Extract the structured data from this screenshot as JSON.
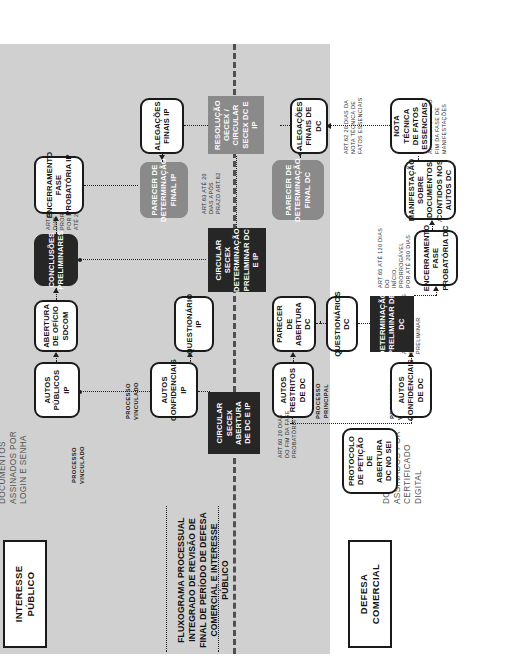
{
  "caption": "Imagem – Prazos processuais nas revisões de final de período com avaliação de interesse público",
  "title": "FLUXOGRAMA PROCESSUAL INTEGRADO DE REVISÃO DE FINAL DE PERÍODO DE DEFESA COMERCIAL E INTERESSE PÚBLICO",
  "headers": {
    "defesa_comercial": "DEFESA\nCOMERCIAL",
    "interesse_publico": "INTERESSE\nPÚBLICO"
  },
  "sidenotes": {
    "digital": "DOCUMENTOS\nASSINADOS POR\nCERTIFICADO\nDIGITAL",
    "login": "DOCUMENTOS\nASSINADOS POR\nLOGIN E SENHA"
  },
  "flow_labels": {
    "processo_principal": "PROCESSO\nPRINCIPAL",
    "processo_vinculado_dc": "PROCESSO\nVINCULADO",
    "processo_vinculado_ip1": "PROCESSO\nVINCULADO",
    "processo_vinculado_ip2": "PROCESSO\nVINCULADO"
  },
  "nodes": {
    "protocolo": {
      "label": "PROTOCOLO DE PETIÇÃO DE ABERTURA DC NO SEI",
      "style": "white"
    },
    "autos_restritos_dc": {
      "label": "AUTOS RESTRITOS DE DC",
      "style": "white"
    },
    "autos_confidenciais_dc": {
      "label": "AUTOS CONFIDENCIAIS DE DC",
      "style": "white"
    },
    "parecer_abertura_dc": {
      "label": "PARECER DE ABERTURA DC",
      "style": "white"
    },
    "questionarios_dc": {
      "label": "QUESTIONÁRIOS DC",
      "style": "white"
    },
    "determinacao_preliminar_dc": {
      "label": "DETERMINAÇÃO PRELIMINAR DE DC",
      "style": "black"
    },
    "encerramento_fase_probatoria_dc": {
      "label": "ENCERRAMENTO FASE PROBATÓRIA DC",
      "style": "white"
    },
    "manifestacao_documentos_dc": {
      "label": "MANIFESTAÇÃO SOBRE DOCUMENTOS CONTIDOS NOS AUTOS DC",
      "style": "white"
    },
    "nota_tecnica_fatos": {
      "label": "NOTA TÉCNICA DE FATOS ESSENCIAIS",
      "style": "white"
    },
    "alegacoes_finais_dc": {
      "label": "ALEGAÇÕES FINAIS DE DC",
      "style": "white"
    },
    "parecer_determinacao_final_dc": {
      "label": "PARECER DE DETERMINAÇÃO FINAL DC",
      "style": "gray"
    },
    "circular_secex_abertura": {
      "label": "CIRCULAR SECEX ABERTURA DE DC E IP",
      "style": "black-square"
    },
    "circular_secex_preliminar": {
      "label": "CIRCULAR SECEX DETERMINAÇÃO PRELIMINAR DC E IP",
      "style": "black-square"
    },
    "resolucao_gecex": {
      "label": "RESOLUÇÃO GECEX / CIRCULAR SECEX DC E IP",
      "style": "gray-square"
    },
    "autos_publicos_ip": {
      "label": "AUTOS PÚBLICOS IP",
      "style": "white"
    },
    "autos_confidenciais_ip": {
      "label": "AUTOS CONFIDENCIAIS IP",
      "style": "white"
    },
    "questionario_ip": {
      "label": "QUESTIONÁRIO IP",
      "style": "white"
    },
    "abertura_oficio_sdcom": {
      "label": "ABERTURA DE OFÍCIO SDCOM",
      "style": "white"
    },
    "conclusoes_preliminares": {
      "label": "CONCLUSÕES PRELIMINARES",
      "style": "black-round"
    },
    "encerramento_fase_probatoria_ip": {
      "label": "ENCERRAMENTO FASE PROBATÓRIA IP",
      "style": "white"
    },
    "alegacoes_finais_ip": {
      "label": "ALEGAÇÕES FINAIS IP",
      "style": "white"
    },
    "parecer_determinacao_final_ip": {
      "label": "PARECER DE DETERMINAÇÃO FINAL IP",
      "style": "gray"
    }
  },
  "notes": {
    "art59": "ART.59 ATÉ 120 DIAS\nDETERMINAÇÃO\nPRELIMINAR",
    "art65_dc": "ART.65  ATÉ 120 DIAS DO\nINÍCIO, PRORROGÁVEL\nPOR ATÉ 200 DIAS",
    "art60_dc": "ART.60",
    "art61": "ART.61  30 DIAS DO\nFIM DA FASE DE\nMANIFESTAÇÕES",
    "art62": "ART.62  20 DIAS DA\nNOTA TÉCNICA DE\nFATOS ESSENCIAIS",
    "art63": "ART.63  ATÉ 20\nDIAS APÓS\nPRAZO ART.62",
    "art60_ip": "ART.60  20 DIAS\nDO FIM DA FASE\nPROBATÓRIA",
    "art65_ip": "ART.65  ATÉ 120\nDIAS DO INÍCIO,\nPRORROGÁVEL POR\nATÉ 200 DIAS",
    "art63_ip": "ART.63  ATÉ 20\nDIAS APÓS\nPRAZO ART.62"
  }
}
